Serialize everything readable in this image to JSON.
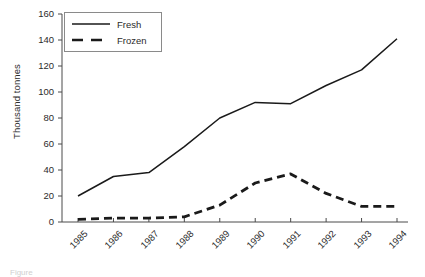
{
  "figure": {
    "ylabel": "Thousand tonnes",
    "caption_partial": "Figure"
  },
  "legend": {
    "position": "top-left-inside",
    "entries": [
      {
        "label": "Fresh",
        "style": "solid",
        "color": "#1a1a1a"
      },
      {
        "label": "Frozen",
        "style": "dashed",
        "color": "#1a1a1a"
      }
    ]
  },
  "axes": {
    "y_ticks": [
      "160",
      "140",
      "120",
      "100",
      "80",
      "60",
      "40",
      "20",
      "0"
    ],
    "x_ticks": [
      "1985",
      "1986",
      "1987",
      "1988",
      "1989",
      "1990",
      "1991",
      "1992",
      "1993",
      "1994"
    ]
  },
  "chart_data": {
    "type": "line",
    "title": "",
    "xlabel": "",
    "ylabel": "Thousand tonnes",
    "categories": [
      "1985",
      "1986",
      "1987",
      "1988",
      "1989",
      "1990",
      "1991",
      "1992",
      "1993",
      "1994"
    ],
    "x": [
      1985,
      1986,
      1987,
      1988,
      1989,
      1990,
      1991,
      1992,
      1993,
      1994
    ],
    "xlim": [
      1985,
      1994
    ],
    "ylim": [
      0,
      160
    ],
    "y_tick_step": 20,
    "grid": false,
    "legend_position": "upper left",
    "series": [
      {
        "name": "Fresh",
        "style": "solid",
        "color": "#1a1a1a",
        "values": [
          20,
          35,
          38,
          58,
          80,
          92,
          91,
          105,
          117,
          141
        ]
      },
      {
        "name": "Frozen",
        "style": "dashed",
        "color": "#1a1a1a",
        "values": [
          2,
          3,
          3,
          4,
          13,
          30,
          37,
          22,
          12,
          12
        ]
      }
    ]
  }
}
